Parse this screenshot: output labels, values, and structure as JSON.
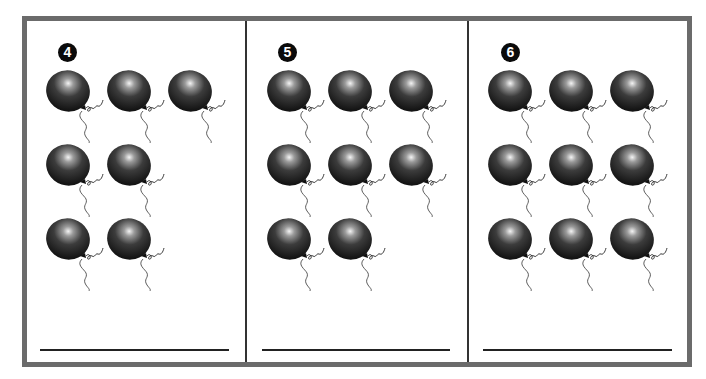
{
  "worksheet": {
    "panels": [
      {
        "number": "4",
        "balloon_count": 7,
        "rows": [
          3,
          2,
          2
        ]
      },
      {
        "number": "5",
        "balloon_count": 8,
        "rows": [
          3,
          3,
          2
        ]
      },
      {
        "number": "6",
        "balloon_count": 9,
        "rows": [
          3,
          3,
          3
        ]
      }
    ],
    "colors": {
      "frame": "#6b6b6b",
      "balloon": "#2a2a2a",
      "badge": "#0a0a0a",
      "line": "#222222"
    }
  }
}
